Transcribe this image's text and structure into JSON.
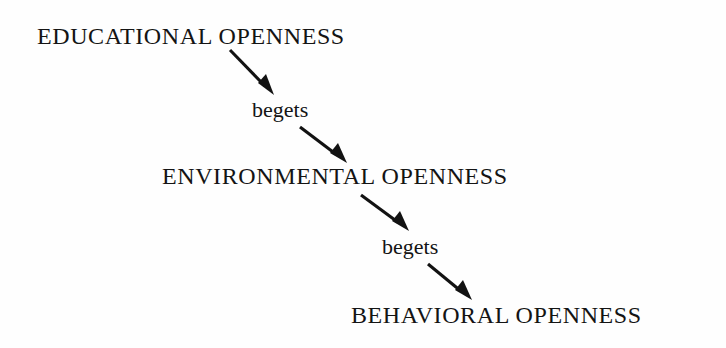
{
  "diagram": {
    "title": "Educational openness begets environmental openness begets behavioral openness",
    "background_color": "#fefefe",
    "ink_color": "#121212",
    "nodes": [
      {
        "id": "educational",
        "label": "EDUCATIONAL OPENNESS"
      },
      {
        "id": "environmental",
        "label": "ENVIRONMENTAL OPENNESS"
      },
      {
        "id": "behavioral",
        "label": "BEHAVIORAL OPENNESS"
      }
    ],
    "links": [
      {
        "id": "begets-1",
        "label": "begets",
        "from": "educational",
        "to": "environmental"
      },
      {
        "id": "begets-2",
        "label": "begets",
        "from": "environmental",
        "to": "behavioral"
      }
    ],
    "arrows": [
      {
        "id": "arrow-1",
        "from": "educational-node",
        "to": "begets-label-1"
      },
      {
        "id": "arrow-2",
        "from": "begets-label-1",
        "to": "environmental-node"
      },
      {
        "id": "arrow-3",
        "from": "environmental-node",
        "to": "begets-label-2"
      },
      {
        "id": "arrow-4",
        "from": "begets-label-2",
        "to": "behavioral-node"
      }
    ]
  }
}
